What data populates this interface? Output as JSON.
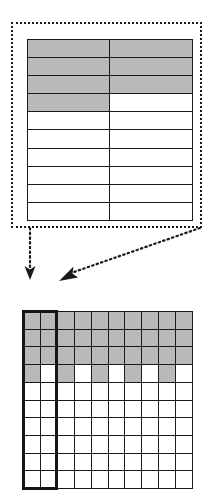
{
  "figure": {
    "name": "grid-decomposition-diagram",
    "colors": {
      "shaded_cell": "#b9b9b9",
      "empty_cell": "#ffffff",
      "line": "#1a1a1a",
      "highlight_border": "#151515",
      "background": "#ffffff"
    }
  },
  "callout": {
    "name": "dotted-callout-box",
    "border_style": "dotted",
    "border_color": "#1a1a1a"
  },
  "detail_table": {
    "name": "detail-table",
    "columns": 2,
    "rows": 10,
    "cells": [
      [
        "shaded",
        "shaded"
      ],
      [
        "shaded",
        "shaded"
      ],
      [
        "shaded",
        "shaded"
      ],
      [
        "shaded",
        "empty"
      ],
      [
        "empty",
        "empty"
      ],
      [
        "empty",
        "empty"
      ],
      [
        "empty",
        "empty"
      ],
      [
        "empty",
        "empty"
      ],
      [
        "empty",
        "empty"
      ],
      [
        "empty",
        "empty"
      ]
    ]
  },
  "arrows": [
    {
      "name": "callout-arrow-left",
      "style": "dotted",
      "direction": "down",
      "from": [
        30,
        3
      ],
      "to": [
        30,
        48
      ]
    },
    {
      "name": "callout-arrow-right",
      "style": "dotted",
      "direction": "down-left",
      "from": [
        200,
        3
      ],
      "to": [
        62,
        50
      ]
    }
  ],
  "main_grid": {
    "name": "main-grid",
    "columns": 10,
    "rows": 10,
    "highlight": {
      "name": "column-highlight-box",
      "columns": [
        1,
        2
      ],
      "rows_span": "all"
    },
    "cells": [
      [
        "shaded",
        "shaded",
        "shaded",
        "shaded",
        "shaded",
        "shaded",
        "shaded",
        "shaded",
        "shaded",
        "shaded"
      ],
      [
        "shaded",
        "shaded",
        "shaded",
        "shaded",
        "shaded",
        "shaded",
        "shaded",
        "shaded",
        "shaded",
        "shaded"
      ],
      [
        "shaded",
        "shaded",
        "shaded",
        "shaded",
        "shaded",
        "shaded",
        "shaded",
        "shaded",
        "shaded",
        "shaded"
      ],
      [
        "shaded",
        "empty",
        "shaded",
        "empty",
        "shaded",
        "empty",
        "shaded",
        "empty",
        "shaded",
        "empty"
      ],
      [
        "empty",
        "empty",
        "empty",
        "empty",
        "empty",
        "empty",
        "empty",
        "empty",
        "empty",
        "empty"
      ],
      [
        "empty",
        "empty",
        "empty",
        "empty",
        "empty",
        "empty",
        "empty",
        "empty",
        "empty",
        "empty"
      ],
      [
        "empty",
        "empty",
        "empty",
        "empty",
        "empty",
        "empty",
        "empty",
        "empty",
        "empty",
        "empty"
      ],
      [
        "empty",
        "empty",
        "empty",
        "empty",
        "empty",
        "empty",
        "empty",
        "empty",
        "empty",
        "empty"
      ],
      [
        "empty",
        "empty",
        "empty",
        "empty",
        "empty",
        "empty",
        "empty",
        "empty",
        "empty",
        "empty"
      ],
      [
        "empty",
        "empty",
        "empty",
        "empty",
        "empty",
        "empty",
        "empty",
        "empty",
        "empty",
        "empty"
      ]
    ]
  }
}
